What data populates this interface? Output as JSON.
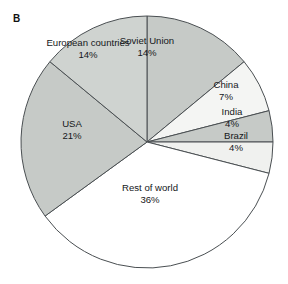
{
  "figure": {
    "panel_label": "B",
    "background": "#ffffff"
  },
  "chart_data": {
    "type": "pie",
    "title": "",
    "xlabel": "",
    "ylabel": "",
    "legend_position": "none",
    "grid": false,
    "units": "percent",
    "total": 100,
    "start_angle_deg": 0,
    "direction": "clockwise",
    "categories": [
      "Soviet Union",
      "China",
      "India",
      "Brazil",
      "Rest of world",
      "USA",
      "European countries"
    ],
    "values": [
      14,
      7,
      4,
      4,
      36,
      21,
      14
    ],
    "value_labels": [
      "14%",
      "7%",
      "4%",
      "4%",
      "36%",
      "21%",
      "14%"
    ],
    "slice_colors": [
      "#c6cac7",
      "#f4f5f3",
      "#c6cac7",
      "#f0f1ef",
      "#ffffff",
      "#c6cac7",
      "#cfd3d0"
    ],
    "slice_stroke": "#4a4f52",
    "slices": [
      {
        "name": "Soviet Union",
        "value": 14,
        "label": "Soviet Union",
        "value_label": "14%",
        "color": "#c6cac7"
      },
      {
        "name": "China",
        "value": 7,
        "label": "China",
        "value_label": "7%",
        "color": "#f4f5f3"
      },
      {
        "name": "India",
        "value": 4,
        "label": "India",
        "value_label": "4%",
        "color": "#c6cac7"
      },
      {
        "name": "Brazil",
        "value": 4,
        "label": "Brazil",
        "value_label": "4%",
        "color": "#f0f1ef"
      },
      {
        "name": "Rest of world",
        "value": 36,
        "label": "Rest of world",
        "value_label": "36%",
        "color": "#ffffff"
      },
      {
        "name": "USA",
        "value": 21,
        "label": "USA",
        "value_label": "21%",
        "color": "#c6cac7"
      },
      {
        "name": "European countries",
        "value": 14,
        "label": "European countries",
        "value_label": "14%",
        "color": "#cfd3d0"
      }
    ]
  },
  "geometry": {
    "center_x": 147,
    "center_y": 142,
    "radius": 126
  },
  "label_positions": [
    {
      "left": 147,
      "top": 47,
      "align": "center"
    },
    {
      "left": 226,
      "top": 91,
      "align": "center"
    },
    {
      "left": 232,
      "top": 118,
      "align": "center"
    },
    {
      "left": 236,
      "top": 142,
      "align": "center"
    },
    {
      "left": 150,
      "top": 194,
      "align": "center"
    },
    {
      "left": 72,
      "top": 130,
      "align": "center"
    },
    {
      "left": 88,
      "top": 49,
      "align": "center"
    }
  ]
}
